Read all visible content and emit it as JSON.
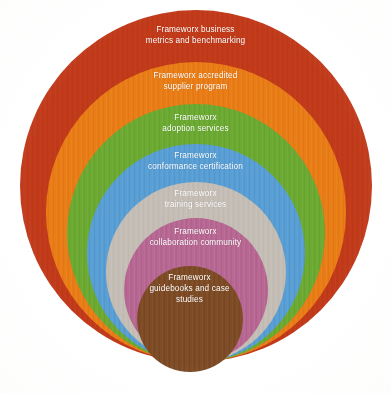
{
  "diagram": {
    "type": "concentric-circles",
    "background_color": "#ffffff",
    "label_color": "#ffffff",
    "rings": [
      {
        "id": "business-metrics",
        "label": "Frameworx business\nmetrics and benchmarking",
        "color": "#c0391a",
        "diameter": 352,
        "center_x": 196,
        "top": 10,
        "label_top": 24
      },
      {
        "id": "accredited-supplier",
        "label": "Frameworx accredited\nsupplier program",
        "color": "#e87b17",
        "diameter": 300,
        "center_x": 196,
        "top": 62,
        "label_top": 70
      },
      {
        "id": "adoption-services",
        "label": "Frameworx\nadoption services",
        "color": "#6aa832",
        "diameter": 258,
        "center_x": 196,
        "top": 104,
        "label_top": 112
      },
      {
        "id": "conformance-certification",
        "label": "Frameworx\nconformance certification",
        "color": "#579cd3",
        "diameter": 218,
        "center_x": 196,
        "top": 144,
        "label_top": 150
      },
      {
        "id": "training-services",
        "label": "Frameworx\ntraining services",
        "color": "#c3bcb4",
        "diameter": 180,
        "center_x": 196,
        "top": 182,
        "label_top": 188
      },
      {
        "id": "collaboration-community",
        "label": "Frameworx\ncollaboration community",
        "color": "#b56690",
        "diameter": 144,
        "center_x": 196,
        "top": 218,
        "label_top": 226
      },
      {
        "id": "guidebooks-case-studies",
        "label": "Frameworx\nguidebooks and case\nstudies",
        "color": "#7b4a25",
        "diameter": 106,
        "center_x": 190,
        "top": 266,
        "label_top": 272
      }
    ]
  }
}
